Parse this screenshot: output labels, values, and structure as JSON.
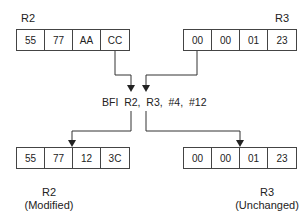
{
  "top": {
    "r2": {
      "label": "R2",
      "cells": [
        "55",
        "77",
        "AA",
        "CC"
      ]
    },
    "r3": {
      "label": "R3",
      "cells": [
        "00",
        "00",
        "01",
        "23"
      ]
    }
  },
  "instruction": "BFI  R2,  R3,  #4,  #12",
  "bottom": {
    "r2": {
      "label": "R2",
      "note": "(Modified)",
      "cells": [
        "55",
        "77",
        "12",
        "3C"
      ]
    },
    "r3": {
      "label": "R3",
      "note": "(Unchanged)",
      "cells": [
        "00",
        "00",
        "01",
        "23"
      ]
    }
  }
}
